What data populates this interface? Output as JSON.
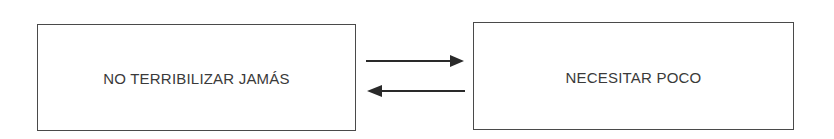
{
  "diagram": {
    "nodes": [
      {
        "id": "left",
        "label": "NO TERRIBILIZAR JAMÁS"
      },
      {
        "id": "right",
        "label": "NECESITAR POCO"
      }
    ],
    "edges": [
      {
        "from": "left",
        "to": "right",
        "direction": "right"
      },
      {
        "from": "right",
        "to": "left",
        "direction": "left"
      }
    ],
    "colors": {
      "stroke": "#4a4a4a",
      "text": "#3a3a3a",
      "arrow": "#2a2a2a",
      "background": "#ffffff"
    }
  }
}
